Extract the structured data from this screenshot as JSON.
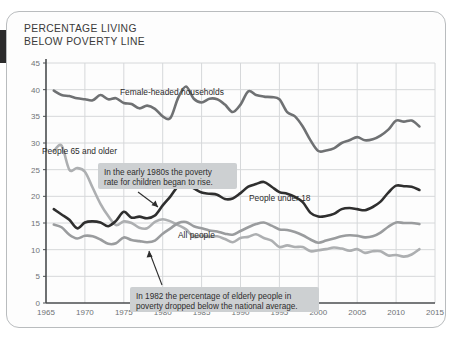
{
  "card": {
    "title": "PERCENTAGE LIVING\nBELOW POVERTY LINE"
  },
  "colors": {
    "under18": "#2f2f2f",
    "female_headed": "#6f7173",
    "all_people": "#9a9c9e",
    "elderly": "#adafb1",
    "grid": "#d6d8da",
    "axis": "#4a4d4f",
    "annotation_bg": "#cdd0d2",
    "card_border": "#b9bcbe",
    "tick_text": "#6f7375"
  },
  "annotations": [
    {
      "id": "children-rise-callout",
      "text_line1": "In the early 1980s the poverty",
      "text_line2": "rate for children began to rise."
    },
    {
      "id": "elderly-below-average-callout",
      "text_line1": "In 1982 the percentage of elderly people in",
      "text_line2": "poverty dropped below the national average."
    }
  ],
  "series_labels": {
    "female_headed": "Female-headed households",
    "elderly": "People 65 and older",
    "under18": "People under 18",
    "all_people": "All people"
  },
  "chart_data": {
    "type": "line",
    "title": "PERCENTAGE LIVING BELOW POVERTY LINE",
    "xlabel": "",
    "ylabel": "",
    "xlim": [
      1965,
      2015
    ],
    "ylim": [
      0,
      45
    ],
    "xticks": [
      1965,
      1970,
      1975,
      1980,
      1985,
      1990,
      1995,
      2000,
      2005,
      2010,
      2015
    ],
    "yticks": [
      0,
      5,
      10,
      15,
      20,
      25,
      30,
      35,
      40,
      45
    ],
    "grid": true,
    "legend": "inline-labels",
    "series": [
      {
        "name": "Female-headed households",
        "color": "#6f7173",
        "x": [
          1966,
          1967,
          1968,
          1969,
          1970,
          1971,
          1972,
          1973,
          1974,
          1975,
          1976,
          1977,
          1978,
          1979,
          1980,
          1981,
          1982,
          1983,
          1984,
          1985,
          1986,
          1987,
          1988,
          1989,
          1990,
          1991,
          1992,
          1993,
          1994,
          1995,
          1996,
          1997,
          1998,
          1999,
          2000,
          2001,
          2002,
          2003,
          2004,
          2005,
          2006,
          2007,
          2008,
          2009,
          2010,
          2011,
          2012,
          2013
        ],
        "values": [
          39.8,
          39.0,
          38.8,
          38.4,
          38.2,
          38.0,
          39.0,
          38.2,
          38.4,
          37.5,
          37.3,
          36.5,
          37.0,
          36.4,
          35.0,
          34.7,
          38.5,
          40.6,
          38.3,
          37.6,
          38.3,
          38.2,
          37.2,
          35.8,
          37.2,
          39.7,
          39.0,
          38.7,
          38.6,
          38.2,
          35.8,
          35.0,
          33.1,
          30.5,
          28.5,
          28.6,
          29.0,
          30.0,
          30.5,
          31.1,
          30.5,
          30.7,
          31.4,
          32.5,
          34.2,
          34.0,
          34.2,
          33.1
        ]
      },
      {
        "name": "People 65 and older",
        "color": "#adafb1",
        "x": [
          1966,
          1967,
          1968,
          1969,
          1970,
          1971,
          1972,
          1973,
          1974,
          1975,
          1976,
          1977,
          1978,
          1979,
          1980,
          1981,
          1982,
          1983,
          1984,
          1985,
          1986,
          1987,
          1988,
          1989,
          1990,
          1991,
          1992,
          1993,
          1994,
          1995,
          1996,
          1997,
          1998,
          1999,
          2000,
          2001,
          2002,
          2003,
          2004,
          2005,
          2006,
          2007,
          2008,
          2009,
          2010,
          2011,
          2012,
          2013
        ],
        "values": [
          28.5,
          29.5,
          25.0,
          25.3,
          24.6,
          21.6,
          18.6,
          16.3,
          14.6,
          15.3,
          15.0,
          14.1,
          14.0,
          15.2,
          15.7,
          15.3,
          14.6,
          13.8,
          12.4,
          12.6,
          12.4,
          12.5,
          12.0,
          11.4,
          12.2,
          12.4,
          12.9,
          12.2,
          11.7,
          10.5,
          10.8,
          10.5,
          10.5,
          9.7,
          9.9,
          10.1,
          10.4,
          10.2,
          9.8,
          10.1,
          9.4,
          9.7,
          9.7,
          8.9,
          9.0,
          8.7,
          9.1,
          10.1
        ]
      },
      {
        "name": "People under 18",
        "color": "#2f2f2f",
        "x": [
          1966,
          1967,
          1968,
          1969,
          1970,
          1971,
          1972,
          1973,
          1974,
          1975,
          1976,
          1977,
          1978,
          1979,
          1980,
          1981,
          1982,
          1983,
          1984,
          1985,
          1986,
          1987,
          1988,
          1989,
          1990,
          1991,
          1992,
          1993,
          1994,
          1995,
          1996,
          1997,
          1998,
          1999,
          2000,
          2001,
          2002,
          2003,
          2004,
          2005,
          2006,
          2007,
          2008,
          2009,
          2010,
          2011,
          2012,
          2013
        ],
        "values": [
          17.6,
          16.6,
          15.6,
          14.0,
          15.1,
          15.3,
          15.1,
          14.4,
          15.4,
          17.1,
          16.0,
          16.2,
          15.9,
          16.4,
          18.3,
          20.0,
          21.9,
          22.3,
          21.5,
          20.7,
          20.5,
          20.3,
          19.5,
          19.6,
          20.6,
          21.8,
          22.3,
          22.7,
          21.8,
          20.8,
          20.5,
          19.9,
          18.9,
          16.9,
          16.2,
          16.3,
          16.7,
          17.6,
          17.8,
          17.6,
          17.4,
          18.0,
          19.0,
          20.7,
          22.0,
          21.9,
          21.8,
          21.2
        ]
      },
      {
        "name": "All people",
        "color": "#9a9c9e",
        "x": [
          1966,
          1967,
          1968,
          1969,
          1970,
          1971,
          1972,
          1973,
          1974,
          1975,
          1976,
          1977,
          1978,
          1979,
          1980,
          1981,
          1982,
          1983,
          1984,
          1985,
          1986,
          1987,
          1988,
          1989,
          1990,
          1991,
          1992,
          1993,
          1994,
          1995,
          1996,
          1997,
          1998,
          1999,
          2000,
          2001,
          2002,
          2003,
          2004,
          2005,
          2006,
          2007,
          2008,
          2009,
          2010,
          2011,
          2012,
          2013
        ],
        "values": [
          14.7,
          14.2,
          12.8,
          12.1,
          12.6,
          12.5,
          11.9,
          11.1,
          11.2,
          12.3,
          11.8,
          11.6,
          11.4,
          11.7,
          13.0,
          14.0,
          15.0,
          15.2,
          14.4,
          14.0,
          13.6,
          13.4,
          13.0,
          12.8,
          13.5,
          14.2,
          14.8,
          15.1,
          14.5,
          13.8,
          13.7,
          13.3,
          12.7,
          11.9,
          11.3,
          11.7,
          12.1,
          12.5,
          12.7,
          12.6,
          12.3,
          12.5,
          13.2,
          14.3,
          15.1,
          15.0,
          15.0,
          14.8
        ]
      }
    ]
  }
}
